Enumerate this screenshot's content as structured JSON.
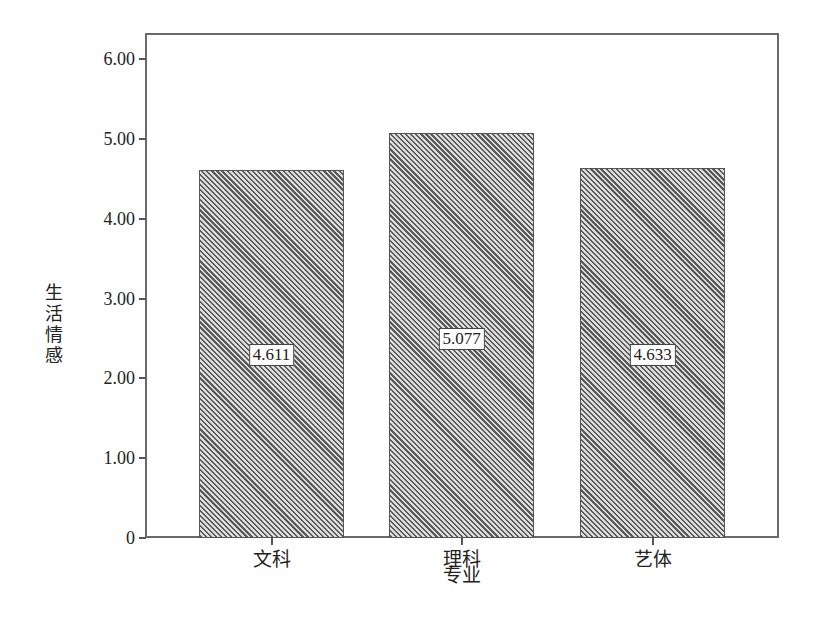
{
  "chart_data": {
    "type": "bar",
    "title": "",
    "xlabel": "专业",
    "ylabel": "生活情感",
    "categories": [
      "文科",
      "理科",
      "艺体"
    ],
    "values": [
      4.611,
      5.077,
      4.633
    ],
    "value_labels": [
      "4.611",
      "5.077",
      "4.633"
    ],
    "ylim": [
      0,
      6.3
    ],
    "yticks": [
      0,
      1.0,
      2.0,
      3.0,
      4.0,
      5.0,
      6.0
    ],
    "ytick_labels": [
      "0",
      "1.00",
      "2.00",
      "3.00",
      "4.00",
      "5.00",
      "6.00"
    ],
    "grid": false,
    "legend": null,
    "bar_fill": "diagonal-hatch",
    "colors": {
      "hatch_dark": "#5a5a5a",
      "hatch_light": "#dcdcdc",
      "frame": "#6a6a6a"
    }
  }
}
